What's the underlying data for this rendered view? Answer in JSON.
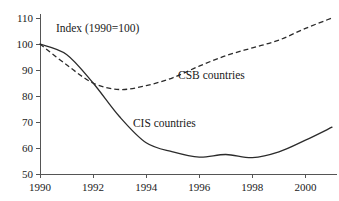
{
  "chart_data": {
    "type": "line",
    "title": "Index (1990=100)",
    "xlabel": "",
    "ylabel": "",
    "xlim": [
      1990,
      2001
    ],
    "ylim": [
      50,
      110
    ],
    "grid": false,
    "legend_position": "inline-annotation",
    "x_ticks": [
      1990,
      1992,
      1994,
      1996,
      1998,
      2000
    ],
    "x_tick_labels": [
      "1990",
      "1992",
      "1994",
      "1996",
      "1998",
      "2000"
    ],
    "y_ticks": [
      50,
      60,
      70,
      80,
      90,
      100,
      110
    ],
    "y_tick_labels": [
      "50",
      "60",
      "70",
      "80",
      "90",
      "100",
      "110"
    ],
    "x": [
      1990,
      1991,
      1992,
      1993,
      1994,
      1995,
      1996,
      1997,
      1998,
      1999,
      2000,
      2001
    ],
    "series": [
      {
        "name": "CSB countries",
        "style": "dashed",
        "color": "#2b2b2b",
        "label_x": 1995.2,
        "label_y": 86.5,
        "values": [
          100,
          92,
          85,
          82.5,
          84,
          87,
          91.5,
          95.5,
          98.5,
          101.5,
          106,
          110
        ]
      },
      {
        "name": "CIS countries",
        "style": "solid",
        "color": "#2b2b2b",
        "label_x": 1993.5,
        "label_y": 68,
        "values": [
          100,
          96,
          85,
          72,
          62,
          58.5,
          56.5,
          57.5,
          56.3,
          58.5,
          63,
          68
        ]
      }
    ],
    "annotations": [
      {
        "text": "Index (1990=100)",
        "x": 1990.6,
        "y": 104.5,
        "name": "chart-title"
      },
      {
        "text": "CSB countries",
        "x": 1995.2,
        "y": 86.5,
        "name": "series-label-csb"
      },
      {
        "text": "CIS countries",
        "x": 1993.5,
        "y": 68,
        "name": "series-label-cis"
      }
    ]
  }
}
